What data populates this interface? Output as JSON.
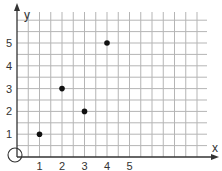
{
  "chart_data": {
    "type": "scatter",
    "title": "",
    "xlabel": "x",
    "ylabel": "y",
    "x_ticks": [
      "1",
      "2",
      "3",
      "4",
      "5"
    ],
    "y_ticks": [
      "1",
      "2",
      "3",
      "4",
      "5"
    ],
    "xlim": [
      0,
      7.5
    ],
    "ylim": [
      0,
      6
    ],
    "grid": true,
    "grid_step": 0.5,
    "origin_marker": "circle",
    "points": [
      {
        "x": 1,
        "y": 1
      },
      {
        "x": 2,
        "y": 3
      },
      {
        "x": 3,
        "y": 2
      },
      {
        "x": 4,
        "y": 5
      }
    ]
  },
  "colors": {
    "grid": "#b5b5b5",
    "axis": "#333333",
    "point": "#111111"
  }
}
